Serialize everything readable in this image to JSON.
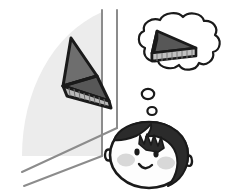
{
  "illustration": {
    "title": "Child mentally rotating a triangular prism displayed on a wall panel",
    "type": "line-art-illustration",
    "canvas": {
      "width": 225,
      "height": 193,
      "background": "#ffffff"
    },
    "palette": {
      "ink": "#1a1a1a",
      "panel_fill": "#ececec",
      "panel_line": "#8c8c8c",
      "solid_top_face": "#6e6e6e",
      "solid_side_face": "#575757",
      "solid_bottom_face": "#b8b8b8",
      "hair": "#2b2b2b",
      "skin": "#fdfdfd",
      "blush": "#d8d8d8",
      "bubble_fill": "#ffffff"
    },
    "elements": [
      {
        "name": "wall-panel",
        "label": "Wall panel",
        "description": "Light gray quarter-round panel with two receding floor lines",
        "fill": "#ececec"
      },
      {
        "name": "panel-edge-line",
        "label": "Panel vertical edge",
        "description": "Vertical gray line at right edge of panel"
      },
      {
        "name": "corner-line",
        "label": "Room corner line",
        "description": "Second vertical gray line right of the panel"
      },
      {
        "name": "floor-line-near",
        "label": "Near floor line",
        "description": "Diagonal gray line running down to the lower left"
      },
      {
        "name": "floor-line-far",
        "label": "Far floor line",
        "description": "Second diagonal gray line below the near floor line"
      },
      {
        "name": "wall-prism",
        "label": "Triangular prism on wall",
        "description": "Dark shaded wedge solid shown at an oblique angle against the panel"
      },
      {
        "name": "thought-bubble",
        "label": "Thought bubble",
        "description": "Cloud shaped thought balloon above the child's head"
      },
      {
        "name": "thought-prism",
        "label": "Imagined triangular prism",
        "description": "The same wedge solid mentally rotated, with a hatched rectangular face"
      },
      {
        "name": "thought-dot-large",
        "label": "Large thought bubble dot"
      },
      {
        "name": "thought-dot-small",
        "label": "Small thought bubble dot"
      },
      {
        "name": "child-face",
        "label": "Child's face",
        "description": "Cartoon child head with dark bowl-cut hair, two eyes, smile and blushed cheeks"
      }
    ],
    "face": {
      "name": "child-face",
      "features": [
        {
          "name": "hair",
          "label": "Hair"
        },
        {
          "name": "left-ear",
          "label": "Left ear"
        },
        {
          "name": "right-ear",
          "label": "Right ear"
        },
        {
          "name": "left-eye",
          "label": "Left eye"
        },
        {
          "name": "right-eye",
          "label": "Right eye"
        },
        {
          "name": "mouth",
          "label": "Smiling mouth"
        },
        {
          "name": "left-cheek",
          "label": "Left blush cheek"
        },
        {
          "name": "right-cheek",
          "label": "Right blush cheek"
        }
      ]
    },
    "caption": ""
  }
}
